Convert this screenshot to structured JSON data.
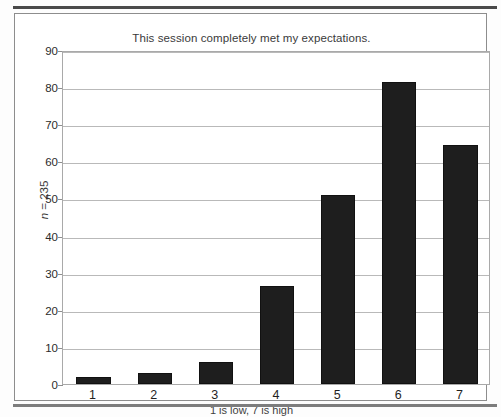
{
  "figure": {
    "y_axis_label_prefix": "n",
    "y_axis_label_suffix": " = 235",
    "bar_color": "#1e1e1e",
    "grid_color": "#b9b9b9"
  },
  "chart_data": {
    "type": "bar",
    "title": "This session completely met my expectations.",
    "xlabel": "1 is low, 7 is high",
    "ylabel": "n = 235",
    "categories": [
      "1",
      "2",
      "3",
      "4",
      "5",
      "6",
      "7"
    ],
    "values": [
      2,
      3,
      6,
      26.5,
      51,
      81.5,
      64.5
    ],
    "ylim": [
      0,
      90
    ],
    "ytick_step": 10,
    "yticks": [
      0,
      10,
      20,
      30,
      40,
      50,
      60,
      70,
      80,
      90
    ],
    "grid": true,
    "legend": "none",
    "sample_size": 235
  }
}
